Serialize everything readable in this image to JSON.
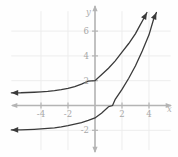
{
  "chart_data": {
    "type": "line",
    "title": "",
    "xlabel": "x",
    "ylabel": "y",
    "xlim": [
      -6.2,
      5.6
    ],
    "ylim": [
      -3.6,
      7.6
    ],
    "grid": true,
    "legend": "none",
    "x_ticks": [
      -4,
      -2,
      2,
      4
    ],
    "x_tick_labels": [
      "-4",
      "-2",
      "2",
      "4"
    ],
    "y_ticks": [
      6,
      4,
      2,
      -2
    ],
    "y_tick_labels": [
      "6",
      "4",
      "2",
      "-2"
    ],
    "series": [
      {
        "name": "upper-curve",
        "description": "increasing exponential with horizontal asymptote y = 1",
        "asymptote": 1,
        "y_intercept": 2,
        "points": [
          [
            -6.2,
            1.02
          ],
          [
            -5.5,
            1.03
          ],
          [
            -5.0,
            1.05
          ],
          [
            -4.5,
            1.07
          ],
          [
            -4.0,
            1.1
          ],
          [
            -3.5,
            1.14
          ],
          [
            -3.0,
            1.2
          ],
          [
            -2.5,
            1.28
          ],
          [
            -2.0,
            1.38
          ],
          [
            -1.5,
            1.52
          ],
          [
            -1.0,
            1.72
          ],
          [
            -0.5,
            1.96
          ],
          [
            0.0,
            2.0
          ],
          [
            0.5,
            2.5
          ],
          [
            1.0,
            3.0
          ],
          [
            1.5,
            3.6
          ],
          [
            2.0,
            4.3
          ],
          [
            2.5,
            5.0
          ],
          [
            3.0,
            5.8
          ],
          [
            3.3,
            6.4
          ],
          [
            3.6,
            7.0
          ],
          [
            3.85,
            7.5
          ]
        ]
      },
      {
        "name": "lower-curve",
        "description": "increasing exponential with horizontal asymptote y = -2",
        "asymptote": -2,
        "y_intercept": -1,
        "x_intercept": 1.3,
        "points": [
          [
            -6.2,
            -1.97
          ],
          [
            -5.5,
            -1.96
          ],
          [
            -5.0,
            -1.94
          ],
          [
            -4.5,
            -1.92
          ],
          [
            -4.0,
            -1.89
          ],
          [
            -3.5,
            -1.85
          ],
          [
            -3.0,
            -1.8
          ],
          [
            -2.5,
            -1.72
          ],
          [
            -2.0,
            -1.62
          ],
          [
            -1.5,
            -1.5
          ],
          [
            -1.0,
            -1.38
          ],
          [
            -0.5,
            -1.2
          ],
          [
            0.0,
            -1.0
          ],
          [
            0.5,
            -0.6
          ],
          [
            1.0,
            -0.1
          ],
          [
            1.3,
            0.0
          ],
          [
            1.5,
            0.5
          ],
          [
            2.0,
            1.3
          ],
          [
            2.5,
            2.2
          ],
          [
            3.0,
            3.2
          ],
          [
            3.5,
            4.4
          ],
          [
            4.0,
            5.7
          ],
          [
            4.35,
            7.0
          ],
          [
            4.55,
            7.5
          ]
        ]
      }
    ],
    "colors": {
      "curve": "#3a3a3a",
      "axis": "#b4b4b4",
      "grid": "#ededed",
      "tick_text": "#a8a8a8",
      "background": "#fefefe"
    }
  },
  "axis_labels": {
    "x": "x",
    "y": "y"
  },
  "ticks": {
    "x": [
      "-4",
      "-2",
      "2",
      "4"
    ],
    "y": [
      "6",
      "4",
      "2",
      "-2"
    ]
  }
}
